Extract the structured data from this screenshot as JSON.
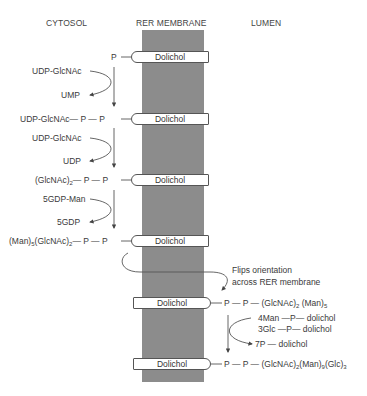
{
  "headers": {
    "cytosol": "CYTOSOL",
    "membrane": "RER MEMBRANE",
    "lumen": "LUMEN"
  },
  "colors": {
    "membrane": "#8c8c8c",
    "lines": "#555555",
    "text": "#3a3a3a"
  },
  "dolichol_label": "Dolichol",
  "steps": [
    {
      "chain": "P",
      "side": "cytosol"
    },
    {
      "donor": "UDP-GlcNAc",
      "product": "UMP"
    },
    {
      "chain": "UDP-GlcNAc — P — P",
      "side": "cytosol"
    },
    {
      "donor": "UDP-GlcNAc",
      "product": "UDP"
    },
    {
      "chain": "(GlcNAc)2 — P — P",
      "side": "cytosol"
    },
    {
      "donor": "5GDP-Man",
      "product": "5GDP"
    },
    {
      "chain": "(Man)5(GlcNAc)2 — P — P",
      "side": "cytosol"
    },
    {
      "note_line1": "Flips orientation",
      "note_line2": "across RER membrane"
    },
    {
      "chain": "P — P — (GlcNAc)2 (Man)5",
      "side": "lumen"
    },
    {
      "donor_line1": "4Man — P — dolichol",
      "donor_line2": "3Glc — P — dolichol",
      "product": "7P — dolichol"
    },
    {
      "chain": "P — P — (GlcNAc)2(Man)9(Glc)3",
      "side": "lumen"
    }
  ],
  "text": {
    "p_single": "P",
    "udp_glcnac_1": "UDP-GlcNAc",
    "ump": "UMP",
    "chain2_prefix": "UDP-GlcNAc",
    "udp_glcnac_2": "UDP-GlcNAc",
    "udp": "UDP",
    "chain3_a": "(GlcNAc)",
    "chain3_sub": "2",
    "gdp_man": "5GDP-Man",
    "gdp": "5GDP",
    "chain4_a": "(Man)",
    "chain4_sub1": "5",
    "chain4_b": "(GlcNAc)",
    "chain4_sub2": "2",
    "flip1": "Flips orientation",
    "flip2": "across RER membrane",
    "chain5_a": "(GlcNAc)",
    "chain5_sub1": "2",
    "chain5_b": " (Man)",
    "chain5_sub2": "5",
    "man_dol": "4Man —P— dolichol",
    "glc_dol": "3Glc —P— dolichol",
    "p_dol": "7P — dolichol",
    "chain6_a": "(GlcNAc)",
    "chain6_sub1": "2",
    "chain6_b": "(Man)",
    "chain6_sub2": "9",
    "chain6_c": "(Glc)",
    "chain6_sub3": "3",
    "dash_p": "— P — P",
    "p_dash_p": "P — P —"
  }
}
